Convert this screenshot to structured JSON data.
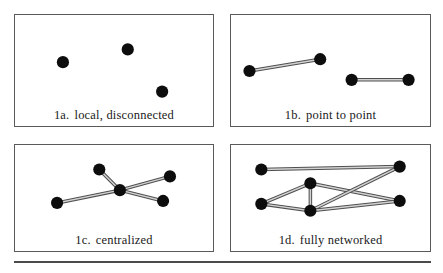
{
  "figure": {
    "width": 443,
    "height": 273,
    "node_color": "#0d0d0d",
    "edge_color": "#4f4f4f",
    "edge_highlight_color": "#d2d2d2",
    "panel_border_color": "#5a5a5a",
    "background_color": "#ffffff"
  },
  "panels": [
    {
      "id": "1a",
      "tag": "1a.",
      "caption": "local, disconnected",
      "box": {
        "x": 14,
        "y": 14,
        "w": 200,
        "h": 113
      },
      "nodes": [
        {
          "name": "node-a1",
          "x": 48,
          "y": 48
        },
        {
          "name": "node-a2",
          "x": 114,
          "y": 35
        },
        {
          "name": "node-a3",
          "x": 149,
          "y": 78
        }
      ],
      "edges": []
    },
    {
      "id": "1b",
      "tag": "1b.",
      "caption": "point to point",
      "box": {
        "x": 230,
        "y": 14,
        "w": 201,
        "h": 113
      },
      "nodes": [
        {
          "name": "node-b1",
          "x": 18,
          "y": 57
        },
        {
          "name": "node-b2",
          "x": 90,
          "y": 45
        },
        {
          "name": "node-b3",
          "x": 122,
          "y": 66
        },
        {
          "name": "node-b4",
          "x": 180,
          "y": 66
        }
      ],
      "edges": [
        {
          "from": 0,
          "to": 1
        },
        {
          "from": 2,
          "to": 3
        }
      ]
    },
    {
      "id": "1c",
      "tag": "1c.",
      "caption": "centralized",
      "box": {
        "x": 14,
        "y": 144,
        "w": 200,
        "h": 108
      },
      "nodes": [
        {
          "name": "node-c-center",
          "x": 106,
          "y": 46
        },
        {
          "name": "node-c-left",
          "x": 42,
          "y": 59
        },
        {
          "name": "node-c-top",
          "x": 85,
          "y": 25
        },
        {
          "name": "node-c-right-upper",
          "x": 157,
          "y": 32
        },
        {
          "name": "node-c-right-lower",
          "x": 150,
          "y": 57
        }
      ],
      "edges": [
        {
          "from": 0,
          "to": 1
        },
        {
          "from": 0,
          "to": 2
        },
        {
          "from": 0,
          "to": 3
        },
        {
          "from": 0,
          "to": 4
        }
      ]
    },
    {
      "id": "1d",
      "tag": "1d.",
      "caption": "fully networked",
      "box": {
        "x": 230,
        "y": 144,
        "w": 201,
        "h": 108
      },
      "nodes": [
        {
          "name": "node-d-top-left",
          "x": 30,
          "y": 25
        },
        {
          "name": "node-d-bottom-left",
          "x": 30,
          "y": 60
        },
        {
          "name": "node-d-center-upper",
          "x": 80,
          "y": 39
        },
        {
          "name": "node-d-center-lower",
          "x": 80,
          "y": 67
        },
        {
          "name": "node-d-top-right",
          "x": 171,
          "y": 22
        },
        {
          "name": "node-d-bottom-right",
          "x": 171,
          "y": 57
        }
      ],
      "edges": [
        {
          "from": 0,
          "to": 4
        },
        {
          "from": 1,
          "to": 2
        },
        {
          "from": 1,
          "to": 3
        },
        {
          "from": 2,
          "to": 3
        },
        {
          "from": 2,
          "to": 5
        },
        {
          "from": 3,
          "to": 4
        },
        {
          "from": 3,
          "to": 5
        }
      ]
    }
  ],
  "node_radius": 6.2
}
